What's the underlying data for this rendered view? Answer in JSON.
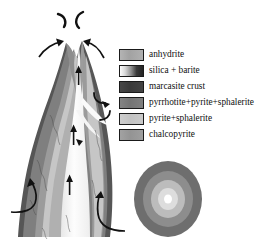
{
  "figure": {
    "background_color": "#ffffff",
    "outline_color": "#1a1a1a"
  },
  "legend": {
    "items": [
      {
        "label": "anhydrite",
        "swatch_name": "swatch-anhydrite",
        "fill_type": "solid",
        "color": "#a8a8a8"
      },
      {
        "label": "silica + barite",
        "swatch_name": "swatch-silica-barite",
        "fill_type": "gradient",
        "color": "#f2f2f2",
        "color2": "#2b2b2b"
      },
      {
        "label": "marcasite crust",
        "swatch_name": "swatch-marcasite-crust",
        "fill_type": "solid",
        "color": "#3d3d3d"
      },
      {
        "label": "pyrrhotite+pyrite+sphalerite",
        "swatch_name": "swatch-pyrrhotite-pyrite-sphalerite",
        "fill_type": "solid",
        "color": "#7a7a7a"
      },
      {
        "label": "pyrite+sphalerite",
        "swatch_name": "swatch-pyrite-sphalerite",
        "fill_type": "solid",
        "color": "#c6c6c6"
      },
      {
        "label": "chalcopyrite",
        "swatch_name": "swatch-chalcopyrite",
        "fill_type": "solid",
        "color": "#9a9a9a"
      }
    ]
  },
  "chimney": {
    "name": "chimney-body",
    "bands": [
      {
        "name": "band-outer-marcasite",
        "color": "#555555"
      },
      {
        "name": "band-pyrrhotite",
        "color": "#7d7d7d"
      },
      {
        "name": "band-chalcopyrite",
        "color": "#9a9a9a"
      },
      {
        "name": "band-pyrite-sphalerite",
        "color": "#c4c4c4"
      },
      {
        "name": "band-anhydrite",
        "color": "#aeaeae"
      },
      {
        "name": "conduit-fluid",
        "color": "#fbfbfb"
      }
    ],
    "upflow_arrow_count": 3,
    "inflow_arrow_count": 2,
    "plume_mark_count": 2,
    "vent_arrow_count": 2
  },
  "cross_section": {
    "name": "chimney-cross-section",
    "rings": [
      {
        "name": "ring-outer",
        "color": "#6e6e6e"
      },
      {
        "name": "ring-mid",
        "color": "#8f8f8f"
      },
      {
        "name": "ring-inner-light",
        "color": "#c0c0c0"
      },
      {
        "name": "ring-inner-pale",
        "color": "#dcdcdc"
      },
      {
        "name": "ring-core",
        "color": "#ffffff"
      }
    ]
  }
}
